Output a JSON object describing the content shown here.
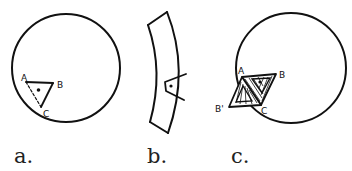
{
  "panels": [
    {
      "id": "a",
      "caption": "a.",
      "description": "Circle with triangle ABC near the edge; side AC dashed",
      "vertex_labels": [
        "A",
        "B",
        "C"
      ]
    },
    {
      "id": "b",
      "caption": "b.",
      "description": "Curved strip (arc segment) containing a small triangle",
      "vertex_labels": []
    },
    {
      "id": "c",
      "caption": "c.",
      "description": "Circle with triangle ABC folded/reflected to B' with hatched shading",
      "vertex_labels": [
        "A",
        "B",
        "C",
        "B'"
      ]
    }
  ],
  "colors": {
    "ink": "#111111",
    "background": "#ffffff"
  }
}
